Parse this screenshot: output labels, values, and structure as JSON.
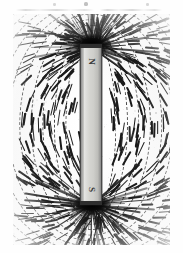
{
  "page": {
    "background_color": "#fefefe",
    "width": 183,
    "height": 253
  },
  "photograph": {
    "subject": "iron-filings-magnetic-field-bar-magnet",
    "medium": "black-and-white photographic print (scanned)",
    "frame": {
      "x": 13,
      "y": 14,
      "width": 157,
      "height": 231
    },
    "ink_color": "#141414",
    "paper_color": "#ffffff"
  },
  "magnet": {
    "label": "bar magnet",
    "orientation": "vertical",
    "body_color": "#cfcfcb",
    "outline_color": "#4a4a4a",
    "bounds": {
      "x": 80,
      "y": 44,
      "width": 22,
      "height": 161
    },
    "poles": [
      {
        "id": "north",
        "symbol": "N",
        "position": "top"
      },
      {
        "id": "south",
        "symbol": "S",
        "position": "bottom"
      }
    ]
  },
  "field": {
    "description": "iron filings aligned along magnetic field lines",
    "line_color": "#1a1a1a",
    "arc_count": 13,
    "pole_burst_rays": 54,
    "speckle_count": 520,
    "densest_regions": [
      "north pole",
      "south pole"
    ]
  },
  "artifacts": {
    "count": 3,
    "description": "faint scanner marks along the top margin",
    "color": "#b9b9b9"
  }
}
